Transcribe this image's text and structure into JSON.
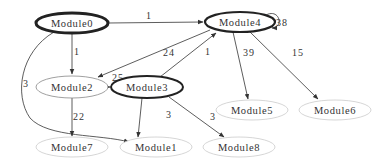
{
  "diagram": {
    "type": "directed-graph",
    "nodes": [
      {
        "id": "Module0",
        "label": "Module0",
        "x": 72,
        "y": 23,
        "rx": 36,
        "ry": 10,
        "weight": "heavy"
      },
      {
        "id": "Module4",
        "label": "Module4",
        "x": 240,
        "y": 22,
        "rx": 35,
        "ry": 10,
        "weight": "heavy"
      },
      {
        "id": "Module2",
        "label": "Module2",
        "x": 72,
        "y": 87,
        "rx": 36,
        "ry": 11,
        "weight": "light"
      },
      {
        "id": "Module3",
        "label": "Module3",
        "x": 147,
        "y": 87,
        "rx": 36,
        "ry": 11,
        "weight": "heavy"
      },
      {
        "id": "Module5",
        "label": "Module5",
        "x": 252,
        "y": 110,
        "rx": 36,
        "ry": 10,
        "weight": "faint"
      },
      {
        "id": "Module6",
        "label": "Module6",
        "x": 335,
        "y": 110,
        "rx": 36,
        "ry": 10,
        "weight": "faint"
      },
      {
        "id": "Module7",
        "label": "Module7",
        "x": 72,
        "y": 147,
        "rx": 36,
        "ry": 10,
        "weight": "faint"
      },
      {
        "id": "Module1",
        "label": "Module1",
        "x": 156,
        "y": 147,
        "rx": 36,
        "ry": 10,
        "weight": "faint"
      },
      {
        "id": "Module8",
        "label": "Module8",
        "x": 239,
        "y": 147,
        "rx": 36,
        "ry": 10,
        "weight": "faint"
      }
    ],
    "edges": [
      {
        "from": "Module0",
        "to": "Module4",
        "label": "1"
      },
      {
        "from": "Module0",
        "to": "Module2",
        "label": "1"
      },
      {
        "from": "Module0",
        "to": "Module1",
        "label": "3"
      },
      {
        "from": "Module4",
        "to": "Module4",
        "label": "38"
      },
      {
        "from": "Module4",
        "to": "Module2",
        "label": "24"
      },
      {
        "from": "Module4",
        "to": "Module5",
        "label": "39"
      },
      {
        "from": "Module4",
        "to": "Module6",
        "label": "15"
      },
      {
        "from": "Module2",
        "to": "Module3",
        "label": "25"
      },
      {
        "from": "Module2",
        "to": "Module7",
        "label": "22"
      },
      {
        "from": "Module3",
        "to": "Module4",
        "label": "1"
      },
      {
        "from": "Module3",
        "to": "Module1",
        "label": "3"
      },
      {
        "from": "Module3",
        "to": "Module8",
        "label": "3"
      }
    ]
  },
  "colors": {
    "heavy_stroke": "#222222",
    "light_stroke": "#888888",
    "faint_stroke": "#cccccc",
    "edge_stroke": "#333333",
    "text": "#333333"
  }
}
